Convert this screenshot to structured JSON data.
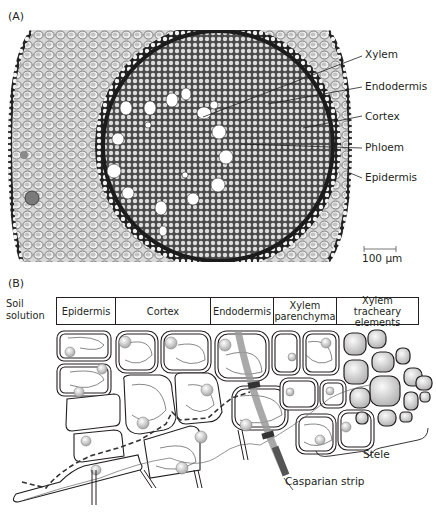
{
  "panel_a": {
    "label": "(A)",
    "callouts": [
      {
        "id": "xylem",
        "text": "Xylem"
      },
      {
        "id": "endodermis",
        "text": "Endodermis"
      },
      {
        "id": "cortex",
        "text": "Cortex"
      },
      {
        "id": "phloem",
        "text": "Phloem"
      },
      {
        "id": "epidermis",
        "text": "Epidermis"
      }
    ],
    "scale_bar": "100 µm"
  },
  "panel_b": {
    "label": "(B)",
    "soil_label_line1": "Soil",
    "soil_label_line2": "solution",
    "columns": [
      {
        "line1": "Epidermis",
        "line2": ""
      },
      {
        "line1": "Cortex",
        "line2": ""
      },
      {
        "line1": "Endodermis",
        "line2": ""
      },
      {
        "line1": "Xylem",
        "line2": "parenchyma"
      },
      {
        "line1": "Xylem tracheary",
        "line2": "elements"
      }
    ],
    "stele_label": "Stele",
    "casparian_label": "Casparian strip"
  },
  "colors": {
    "ink": "#231f20",
    "casparian_band": "#9a9a9a",
    "casparian_dark": "#555555",
    "photo_bg": "#bdbdbd"
  }
}
